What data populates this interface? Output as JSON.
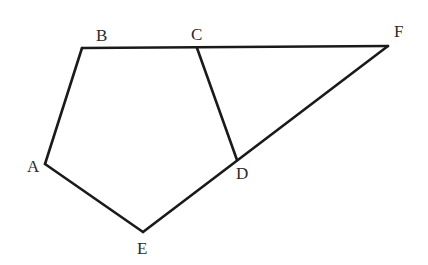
{
  "diagram": {
    "type": "geometry-figure",
    "stroke_color": "#1a1a1a",
    "label_color": "#2a2a2a",
    "vertices": {
      "A": {
        "x": 45,
        "y": 164
      },
      "B": {
        "x": 82,
        "y": 48
      },
      "C": {
        "x": 197,
        "y": 48
      },
      "D": {
        "x": 237,
        "y": 160
      },
      "E": {
        "x": 143,
        "y": 232
      },
      "F": {
        "x": 388,
        "y": 46
      }
    },
    "labels": [
      {
        "name": "A",
        "text": "A",
        "x": 27,
        "y": 172
      },
      {
        "name": "B",
        "text": "B",
        "x": 96,
        "y": 41
      },
      {
        "name": "C",
        "text": "C",
        "x": 191,
        "y": 40
      },
      {
        "name": "D",
        "text": "D",
        "x": 236,
        "y": 179
      },
      {
        "name": "E",
        "text": "E",
        "x": 137,
        "y": 254
      },
      {
        "name": "F",
        "text": "F",
        "x": 394,
        "y": 37
      }
    ],
    "segments": [
      {
        "name": "AB",
        "from": "A",
        "to": "B"
      },
      {
        "name": "BF",
        "from": "B",
        "to": "F"
      },
      {
        "name": "CD",
        "from": "C",
        "to": "D"
      },
      {
        "name": "EF",
        "from": "E",
        "to": "F"
      },
      {
        "name": "AE",
        "from": "A",
        "to": "E"
      }
    ]
  }
}
